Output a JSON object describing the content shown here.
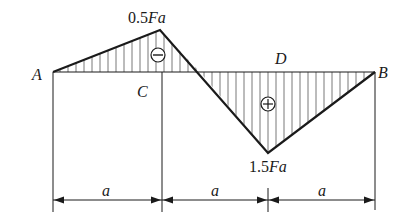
{
  "diagram": {
    "points": {
      "A": "A",
      "B": "B",
      "C": "C",
      "D": "D"
    },
    "values": {
      "max_negative": {
        "num": "0.5",
        "sym": "Fa"
      },
      "max_positive": {
        "num": "1.5",
        "sym": "Fa"
      }
    },
    "signs": {
      "negative": "−",
      "positive": "+"
    },
    "dimensions": [
      {
        "label": "a"
      },
      {
        "label": "a"
      },
      {
        "label": "a"
      }
    ],
    "colors": {
      "line": "#1a1a1a",
      "hatch": "#555555",
      "background": "#ffffff"
    }
  }
}
